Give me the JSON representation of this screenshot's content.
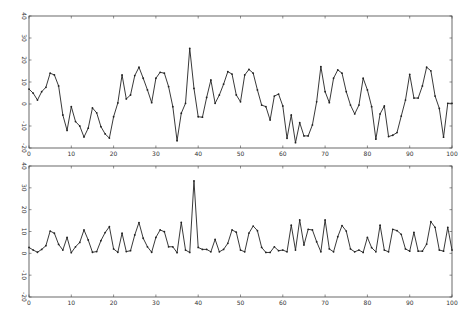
{
  "chart_data": [
    {
      "type": "line",
      "title": "",
      "xlabel": "",
      "ylabel": "",
      "xlim": [
        0,
        100
      ],
      "ylim": [
        -20,
        40
      ],
      "xticks": [
        0,
        10,
        20,
        30,
        40,
        50,
        60,
        70,
        80,
        90,
        100
      ],
      "yticks": [
        -20,
        -10,
        0,
        10,
        20,
        30,
        40
      ],
      "grid": false,
      "legend": null,
      "marker": "dot",
      "series": [
        {
          "name": "top",
          "x": [
            0,
            1,
            2,
            3,
            4,
            5,
            6,
            7,
            8,
            9,
            10,
            11,
            12,
            13,
            14,
            15,
            16,
            17,
            18,
            19,
            20,
            21,
            22,
            23,
            24,
            25,
            26,
            27,
            28,
            29,
            30,
            31,
            32,
            33,
            34,
            35,
            36,
            37,
            38,
            39,
            40,
            41,
            42,
            43,
            44,
            45,
            46,
            47,
            48,
            49,
            50,
            51,
            52,
            53,
            54,
            55,
            56,
            57,
            58,
            59,
            60,
            61,
            62,
            63,
            64,
            65,
            66,
            67,
            68,
            69,
            70,
            71,
            72,
            73,
            74,
            75,
            76,
            77,
            78,
            79,
            80,
            81,
            82,
            83,
            84,
            85,
            86,
            87,
            88,
            89,
            90,
            91,
            92,
            93,
            94,
            95,
            96,
            97,
            98,
            99,
            100
          ],
          "values": [
            6.8,
            4.9,
            1.8,
            5.6,
            7.6,
            14,
            13.2,
            8.2,
            -5,
            -12,
            -1.2,
            -8,
            -10,
            -15,
            -11,
            -1.8,
            -4,
            -10.3,
            -13.6,
            -15.5,
            -5.8,
            0.5,
            13.2,
            2.3,
            4.1,
            12.9,
            16.7,
            11.7,
            6.4,
            0.6,
            11.7,
            14.4,
            14,
            7.9,
            -1.2,
            -16.7,
            -4.2,
            0.3,
            25.3,
            7.1,
            -5.8,
            -6,
            3,
            10.9,
            0.3,
            4.1,
            9,
            14.7,
            13.6,
            4.1,
            1,
            13.2,
            15.7,
            14,
            6.4,
            -0.5,
            -1.2,
            -7.3,
            3.6,
            4.5,
            -0.9,
            -15.6,
            -5,
            -17.6,
            -8.5,
            -14.5,
            -14.5,
            -9.5,
            1,
            17,
            5.6,
            0.6,
            11.7,
            15.5,
            14,
            5.6,
            -0.5,
            -4.5,
            -0.5,
            11.7,
            6.4,
            -1.2,
            -16,
            -4.5,
            -0.9,
            -14.8,
            -14.2,
            -13,
            -5.5,
            1.8,
            13.5,
            2.7,
            2.7,
            8.2,
            16.7,
            15.1,
            3.6,
            -2,
            -15.1,
            0.3,
            0.3
          ]
        }
      ]
    },
    {
      "type": "line",
      "title": "",
      "xlabel": "",
      "ylabel": "",
      "xlim": [
        0,
        100
      ],
      "ylim": [
        -20,
        40
      ],
      "xticks": [
        0,
        10,
        20,
        30,
        40,
        50,
        60,
        70,
        80,
        90,
        100
      ],
      "yticks": [
        -20,
        -10,
        0,
        10,
        20,
        30,
        40
      ],
      "grid": false,
      "legend": null,
      "marker": "dot",
      "series": [
        {
          "name": "bottom",
          "x": [
            0,
            1,
            2,
            3,
            4,
            5,
            6,
            7,
            8,
            9,
            10,
            11,
            12,
            13,
            14,
            15,
            16,
            17,
            18,
            19,
            20,
            21,
            22,
            23,
            24,
            25,
            26,
            27,
            28,
            29,
            30,
            31,
            32,
            33,
            34,
            35,
            36,
            37,
            38,
            39,
            40,
            41,
            42,
            43,
            44,
            45,
            46,
            47,
            48,
            49,
            50,
            51,
            52,
            53,
            54,
            55,
            56,
            57,
            58,
            59,
            60,
            61,
            62,
            63,
            64,
            65,
            66,
            67,
            68,
            69,
            70,
            71,
            72,
            73,
            74,
            75,
            76,
            77,
            78,
            79,
            80,
            81,
            82,
            83,
            84,
            85,
            86,
            87,
            88,
            89,
            90,
            91,
            92,
            93,
            94,
            95,
            96,
            97,
            98,
            99,
            100
          ],
          "values": [
            2.7,
            1.5,
            0.5,
            1.8,
            3.5,
            10.2,
            9.2,
            4.1,
            1.5,
            7.3,
            0.3,
            3,
            5,
            10.7,
            6.1,
            0.5,
            0.8,
            5.8,
            9.5,
            12.2,
            2,
            0.5,
            9.2,
            0.8,
            1.2,
            8.4,
            14.1,
            6.9,
            3,
            0.5,
            7.3,
            10.7,
            9.9,
            3,
            3,
            0.3,
            14.2,
            1.5,
            0.4,
            33.2,
            2.7,
            1.8,
            1.8,
            0.7,
            6.4,
            0.7,
            1.8,
            4.6,
            10.7,
            9.7,
            1.5,
            0.7,
            9.3,
            12.5,
            10.4,
            2.7,
            0.4,
            0.4,
            3,
            1.2,
            1.5,
            0.7,
            12.9,
            1.5,
            15.3,
            3.8,
            11,
            10.7,
            5.3,
            0.7,
            15.3,
            2,
            0.7,
            7.6,
            12.7,
            10.2,
            2,
            0.7,
            1.5,
            0.4,
            7.3,
            2.6,
            0.7,
            12.9,
            1.5,
            0.7,
            11,
            10.4,
            8.7,
            2,
            1,
            9.6,
            1,
            1,
            4.2,
            14.5,
            11.9,
            1.5,
            1,
            11.9,
            1.5
          ]
        }
      ]
    }
  ],
  "axes": [
    {
      "id": "top",
      "xtick_labels": [
        "0",
        "10",
        "20",
        "30",
        "40",
        "50",
        "60",
        "70",
        "80",
        "90",
        "100"
      ],
      "ytick_labels": [
        "-20",
        "-10",
        "0",
        "10",
        "20",
        "30",
        "40"
      ]
    },
    {
      "id": "bottom",
      "xtick_labels": [
        "0",
        "10",
        "20",
        "30",
        "40",
        "50",
        "60",
        "70",
        "80",
        "90",
        "100"
      ],
      "ytick_labels": [
        "-20",
        "-10",
        "0",
        "10",
        "20",
        "30",
        "40"
      ]
    }
  ],
  "colors": {
    "line": "#222222",
    "axis": "#444444",
    "background": "#ffffff"
  }
}
